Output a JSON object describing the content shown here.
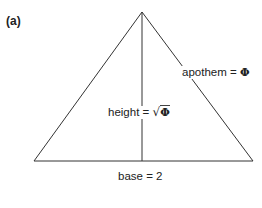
{
  "figure": {
    "panel_label": "(a)",
    "shape": "isosceles-triangle",
    "stroke_color": "#333333",
    "vertices": {
      "apex": [
        142,
        12
      ],
      "base_left": [
        34,
        161
      ],
      "base_right": [
        253,
        161
      ]
    },
    "height_line": {
      "from": [
        142,
        12
      ],
      "to": [
        142,
        161
      ]
    }
  },
  "labels": {
    "apothem": {
      "name": "apothem",
      "eq": "=",
      "value": "Φ"
    },
    "height": {
      "name": "height",
      "eq": "=",
      "radical": "√",
      "value": "Φ"
    },
    "base": {
      "name": "base",
      "eq": "=",
      "value": "2"
    }
  }
}
